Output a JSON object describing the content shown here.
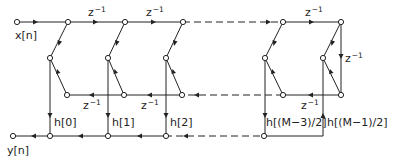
{
  "diagram": {
    "type": "signal-flow-graph",
    "input_label": "x[n]",
    "output_label": "y[n]",
    "delay_label_base": "z",
    "delay_label_exp": "−1",
    "coefficients": [
      {
        "id": "h0",
        "label": "h[0]"
      },
      {
        "id": "h1",
        "label": "h[1]"
      },
      {
        "id": "h2",
        "label": "h[2]"
      },
      {
        "id": "hM3",
        "label": "h[(M−3)/2]"
      },
      {
        "id": "hM1",
        "label": "h[(M−1)/2]"
      }
    ],
    "top_delays": [
      {
        "id": "td1",
        "base": "z",
        "exp": "−1"
      },
      {
        "id": "td2",
        "base": "z",
        "exp": "−1"
      },
      {
        "id": "td3",
        "base": "z",
        "exp": "−1"
      }
    ],
    "bottom_delays": [
      {
        "id": "bd1",
        "base": "z",
        "exp": "−1"
      },
      {
        "id": "bd2",
        "base": "z",
        "exp": "−1"
      },
      {
        "id": "bd3",
        "base": "z",
        "exp": "−1"
      }
    ],
    "turn_delay": {
      "base": "z",
      "exp": "−1"
    }
  }
}
